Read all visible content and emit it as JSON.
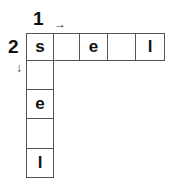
{
  "puzzle": {
    "clues": [
      {
        "number": "1",
        "direction": "across",
        "arrow": "→"
      },
      {
        "number": "2",
        "direction": "down",
        "arrow": "↓"
      }
    ],
    "across": [
      "s",
      "",
      "e",
      "",
      "l"
    ],
    "down": [
      "s",
      "",
      "e",
      "",
      "l"
    ]
  }
}
